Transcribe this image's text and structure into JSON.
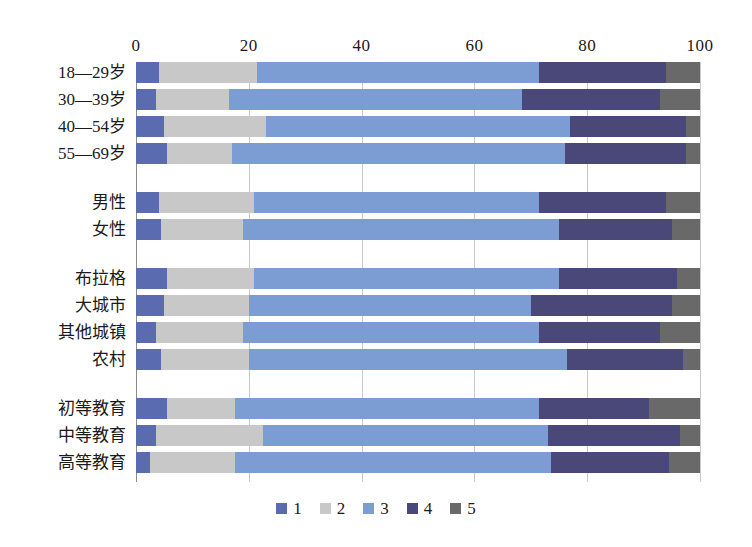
{
  "chart_data": {
    "type": "bar",
    "orientation": "horizontal",
    "stacked": true,
    "stack_mode": "percent",
    "title": "",
    "subtitle": "",
    "xlabel": "",
    "ylabel": "",
    "xlim": [
      0,
      100
    ],
    "xticks": [
      0,
      20,
      40,
      60,
      80,
      100
    ],
    "xtick_labels": [
      "0",
      "20",
      "40",
      "60",
      "80",
      "100"
    ],
    "grid": true,
    "grid_axis": "x",
    "legend_position": "bottom",
    "legend": [
      "1",
      "2",
      "3",
      "4",
      "5"
    ],
    "series_colors": [
      "#5b6bb0",
      "#c8c8c8",
      "#7b9dd4",
      "#4a4878",
      "#696969"
    ],
    "groups": [
      {
        "name": "age",
        "categories": [
          "18—29岁",
          "30—39岁",
          "40—54岁",
          "55—69岁"
        ],
        "values": [
          [
            4,
            17.5,
            50,
            22.5,
            6
          ],
          [
            3.5,
            13,
            52,
            24.5,
            7
          ],
          [
            5,
            18,
            54,
            20.5,
            2.5
          ],
          [
            5.5,
            11.5,
            59,
            21.5,
            2.5
          ]
        ]
      },
      {
        "name": "gender",
        "categories": [
          "男性",
          "女性"
        ],
        "values": [
          [
            4,
            17,
            50.5,
            22.5,
            6
          ],
          [
            4.5,
            14.5,
            56,
            20,
            5
          ]
        ]
      },
      {
        "name": "region",
        "categories": [
          "布拉格",
          "大城市",
          "其他城镇",
          "农村"
        ],
        "values": [
          [
            5.5,
            15.5,
            54,
            21,
            4
          ],
          [
            5,
            15,
            50,
            25,
            5
          ],
          [
            3.5,
            15.5,
            52.5,
            21.5,
            7
          ],
          [
            4.5,
            15.5,
            56.5,
            20.5,
            3
          ]
        ]
      },
      {
        "name": "education",
        "categories": [
          "初等教育",
          "中等教育",
          "高等教育"
        ],
        "values": [
          [
            5.5,
            12,
            54,
            19.5,
            9
          ],
          [
            3.5,
            19,
            50.5,
            23.5,
            3.5
          ],
          [
            2.5,
            15,
            56,
            21,
            5.5
          ]
        ]
      }
    ],
    "all_categories": [
      "18—29岁",
      "30—39岁",
      "40—54岁",
      "55—69岁",
      "男性",
      "女性",
      "布拉格",
      "大城市",
      "其他城镇",
      "农村",
      "初等教育",
      "中等教育",
      "高等教育"
    ]
  },
  "colors": {
    "series_1": "#5b6bb0",
    "series_2": "#c8c8c8",
    "series_3": "#7b9dd4",
    "series_4": "#4a4878",
    "series_5": "#696969",
    "gridline": "#c9c9c9",
    "axis": "#8a8a8a",
    "background": "#ffffff",
    "text": "#1a1a1a"
  }
}
